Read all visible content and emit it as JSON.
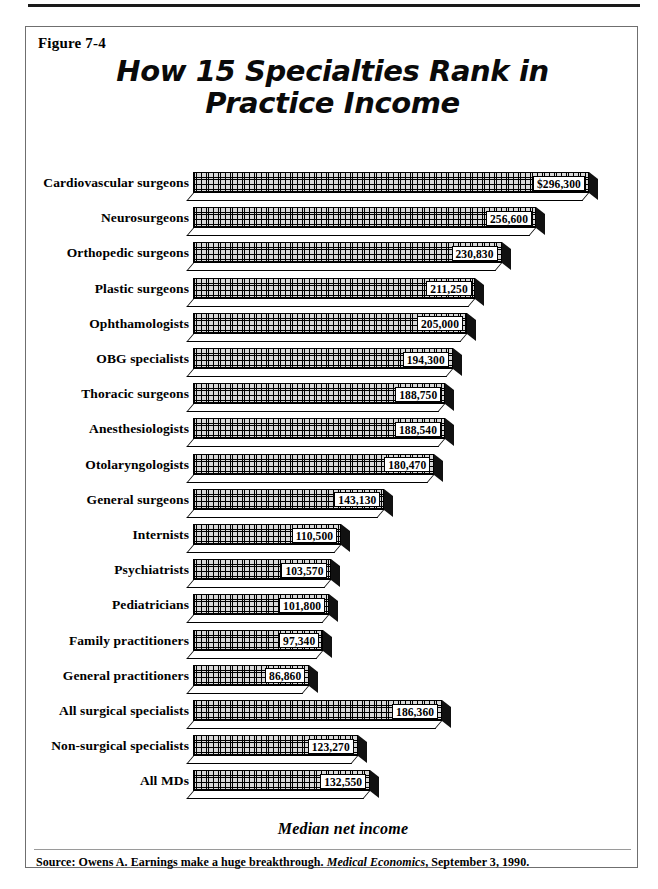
{
  "figure": {
    "number_label": "Figure 7-4",
    "caption_axis": "Median net income",
    "source_prefix": "Source: Owens A. Earnings make a huge breakthrough.",
    "source_journal": "Medical Economics",
    "source_suffix": ", September 3, 1990."
  },
  "colors": {
    "ink": "#000000",
    "frame": "#6f6f6f",
    "bar_fill": "#d8d8d8",
    "bar_side": "#111111",
    "page": "#ffffff"
  },
  "chart_data": {
    "type": "bar",
    "orientation": "horizontal",
    "title": "How 15 Specialties Rank in Practice Income",
    "title_line1": "How 15 Specialties Rank in",
    "title_line2": "Practice Income",
    "xlabel": "Median net income",
    "ylabel": "",
    "xlim": [
      0,
      296300
    ],
    "grid": false,
    "legend": false,
    "value_prefix_first": "$",
    "categories": [
      "Cardiovascular surgeons",
      "Neurosurgeons",
      "Orthopedic surgeons",
      "Plastic surgeons",
      "Ophthamologists",
      "OBG specialists",
      "Thoracic  surgeons",
      "Anesthesiologists",
      "Otolaryngologists",
      "General surgeons",
      "Internists",
      "Psychiatrists",
      "Pediatricians",
      "Family practitioners",
      "General practitioners",
      "All surgical specialists",
      "Non-surgical specialists",
      "All MDs"
    ],
    "values": [
      296300,
      256600,
      230830,
      211250,
      205000,
      194300,
      188750,
      188540,
      180470,
      143130,
      110500,
      103570,
      101800,
      97340,
      86860,
      186360,
      123270,
      132550
    ],
    "value_labels": [
      "$296,300",
      "256,600",
      "230,830",
      "211,250",
      "205,000",
      "194,300",
      "188,750",
      "188,540",
      "180,470",
      "143,130",
      "110,500",
      "103,570",
      "101,800",
      "97,340",
      "86,860",
      "186,360",
      "123,270",
      "132,550"
    ]
  }
}
